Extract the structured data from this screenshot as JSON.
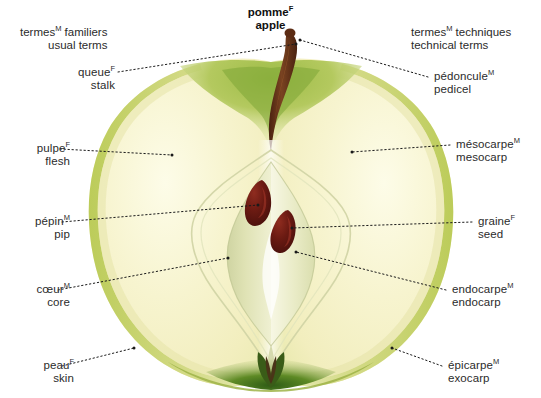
{
  "title": {
    "french": "pomme",
    "french_gender": "F",
    "english": "apple"
  },
  "headers": {
    "left": {
      "french": "termes",
      "french_gender": "M",
      "french_rest": " familiers",
      "english": "usual terms"
    },
    "right": {
      "french": "termes",
      "french_gender": "M",
      "french_rest": " techniques",
      "english": "technical terms"
    }
  },
  "labels": [
    {
      "id": "queue-stalk",
      "side": "left",
      "french": "queue",
      "gender": "F",
      "english": "stalk",
      "text_x": 55,
      "text_y": 62,
      "align": "right",
      "leader": [
        [
          118,
          72
        ],
        [
          296,
          44
        ]
      ]
    },
    {
      "id": "pulpe-flesh",
      "side": "left",
      "french": "pulpe",
      "gender": "F",
      "english": "flesh",
      "text_x": 10,
      "text_y": 138,
      "align": "right",
      "leader": [
        [
          60,
          149
        ],
        [
          172,
          155
        ]
      ]
    },
    {
      "id": "pepin-pip",
      "side": "left",
      "french": "pépin",
      "gender": "M",
      "english": "pip",
      "text_x": 10,
      "text_y": 211,
      "align": "right",
      "leader": [
        [
          62,
          222
        ],
        [
          258,
          205
        ]
      ]
    },
    {
      "id": "coeur-core",
      "side": "left",
      "french": "cœur",
      "gender": "M",
      "english": "core",
      "text_x": 10,
      "text_y": 279,
      "align": "right",
      "leader": [
        [
          58,
          290
        ],
        [
          228,
          258
        ]
      ]
    },
    {
      "id": "peau-skin",
      "side": "left",
      "french": "peau",
      "gender": "F",
      "english": "skin",
      "text_x": 14,
      "text_y": 355,
      "align": "right",
      "leader": [
        [
          62,
          366
        ],
        [
          134,
          348
        ]
      ]
    },
    {
      "id": "pedoncule-pedicel",
      "side": "right",
      "french": "pédoncule",
      "gender": "M",
      "english": "pedicel",
      "text_x": 434,
      "text_y": 66,
      "align": "left",
      "leader": [
        [
          428,
          77
        ],
        [
          300,
          40
        ]
      ]
    },
    {
      "id": "mesocarpe-mesocarp",
      "side": "right",
      "french": "mésocarpe",
      "gender": "M",
      "english": "mesocarp",
      "text_x": 456,
      "text_y": 134,
      "align": "left",
      "leader": [
        [
          450,
          145
        ],
        [
          352,
          152
        ]
      ]
    },
    {
      "id": "graine-seed",
      "side": "right",
      "french": "graine",
      "gender": "F",
      "english": "seed",
      "text_x": 478,
      "text_y": 211,
      "align": "left",
      "leader": [
        [
          472,
          222
        ],
        [
          292,
          228
        ]
      ]
    },
    {
      "id": "endocarpe-endocarp",
      "side": "right",
      "french": "endocarpe",
      "gender": "M",
      "english": "endocarp",
      "text_x": 452,
      "text_y": 279,
      "align": "left",
      "leader": [
        [
          446,
          290
        ],
        [
          296,
          252
        ]
      ]
    },
    {
      "id": "epicarpe-exocarp",
      "side": "right",
      "french": "épicarpe",
      "gender": "M",
      "english": "exocarp",
      "text_x": 448,
      "text_y": 355,
      "align": "left",
      "leader": [
        [
          442,
          366
        ],
        [
          392,
          348
        ]
      ]
    }
  ],
  "illustration": {
    "subject": "apple-longitudinal-cross-section",
    "colors": {
      "flesh": "#f5f2c8",
      "flesh_light": "#fbf9e2",
      "skin": "#c9d468",
      "skin_dark": "#a8bb45",
      "core_chamber": "#e8e9bd",
      "core_chamber_dark": "#cfd3a0",
      "seed": "#5e1410",
      "seed_highlight": "#8c2a1e",
      "stalk": "#5a2a15",
      "stalk_light": "#7d4422",
      "calyx": "#3f6b1f",
      "stem_well_green": "#8fb23c",
      "leader_line": "#1a1a1a",
      "text": "#2b2b2b"
    }
  }
}
